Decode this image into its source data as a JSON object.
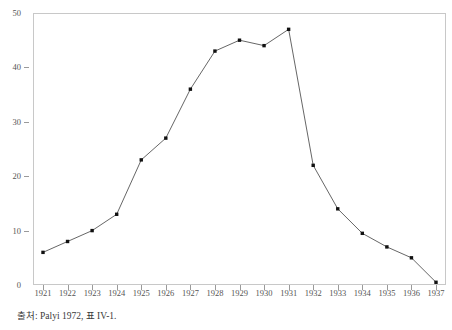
{
  "chart_data": {
    "type": "line",
    "title": "",
    "subtitle": "",
    "xlabel": "",
    "ylabel": "",
    "categories": [
      "1921",
      "1922",
      "1923",
      "1924",
      "1925",
      "1926",
      "1927",
      "1928",
      "1929",
      "1930",
      "1931",
      "1932",
      "1933",
      "1934",
      "1935",
      "1936",
      "1937"
    ],
    "values": [
      6,
      8,
      10,
      13,
      23,
      27,
      36,
      43,
      45,
      44,
      47,
      22,
      14,
      9.5,
      7,
      5,
      0.5
    ],
    "series": [
      {
        "name": "",
        "values": [
          6,
          8,
          10,
          13,
          23,
          27,
          36,
          43,
          45,
          44,
          47,
          22,
          14,
          9.5,
          7,
          5,
          0.5
        ]
      }
    ],
    "xlim": [
      1921,
      1937
    ],
    "ylim": [
      0,
      50
    ],
    "y_ticks": [
      0,
      10,
      20,
      30,
      40,
      50
    ],
    "y_tick_labels": [
      "0",
      "10",
      "20",
      "30",
      "40",
      "50"
    ],
    "x_ticks": [
      "1921",
      "1922",
      "1923",
      "1924",
      "1925",
      "1926",
      "1927",
      "1928",
      "1929",
      "1930",
      "1931",
      "1932",
      "1933",
      "1934",
      "1935",
      "1936",
      "1937"
    ],
    "grid": false,
    "legend": "none",
    "marker": "square",
    "line_color": "#555555",
    "marker_color": "#111111",
    "frame_color": "#c8c8c8",
    "annotations": []
  },
  "figure": {
    "source_note": "출처: Palyi 1972, 표 IV-1."
  }
}
